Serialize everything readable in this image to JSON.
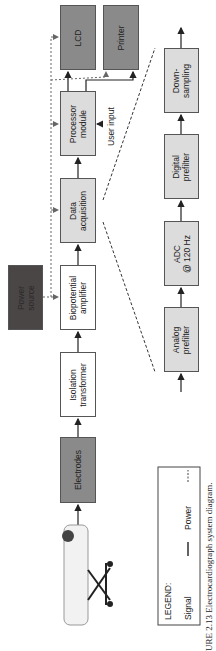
{
  "figure": {
    "caption": "URE 2.13  Electrocardiograph system diagram.",
    "orientation": "rotated 90° counter-clockwise"
  },
  "blocks": {
    "lcd": "LCD",
    "printer": "Printer",
    "processor": "Processor\nmodule",
    "data_acquisition": "Data\nacquisition",
    "biopotential": "Biopotential\namplifier",
    "isolation": "Isolation\ntransformer",
    "electrodes": "Electrodes",
    "power": "Power\nsource"
  },
  "user_input_label": "User input",
  "subchain": {
    "analog": "Analog\nprefilter",
    "adc": "ADC\n@ 120 Hz",
    "digital": "Digital\nprefilter",
    "downsampling": "Down-\nsampling"
  },
  "legend": {
    "title": "LEGEND:",
    "signal_label": "Signal",
    "power_label": "Power"
  },
  "colors": {
    "dark_box": "#8a8a8a",
    "light_box": "#dcdcdc",
    "power_box": "#4a4646",
    "line": "#222222"
  }
}
